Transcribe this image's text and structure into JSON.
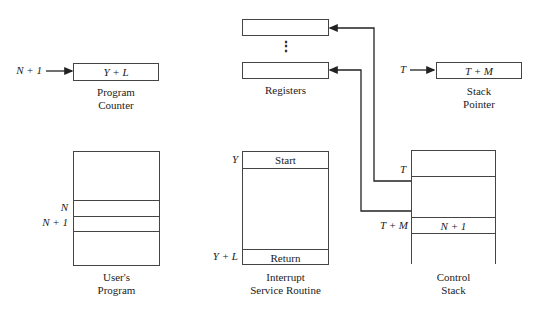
{
  "program_counter": {
    "input": "N + 1",
    "value": "Y + L",
    "caption_line1": "Program",
    "caption_line2": "Counter"
  },
  "registers": {
    "caption": "Registers",
    "ellipsis": "⋮"
  },
  "stack_pointer": {
    "input": "T",
    "value": "T + M",
    "caption_line1": "Stack",
    "caption_line2": "Pointer"
  },
  "users_program": {
    "row_n": "N",
    "row_n1": "N + 1",
    "caption_line1": "User's",
    "caption_line2": "Program"
  },
  "isr": {
    "start_addr": "Y",
    "start_label": "Start",
    "return_addr": "Y + L",
    "return_label": "Return",
    "caption_line1": "Interrupt",
    "caption_line2": "Service Routine"
  },
  "control_stack": {
    "addr_t": "T",
    "addr_tm": "T + M",
    "cell_tm": "N + 1",
    "caption_line1": "Control",
    "caption_line2": "Stack"
  }
}
